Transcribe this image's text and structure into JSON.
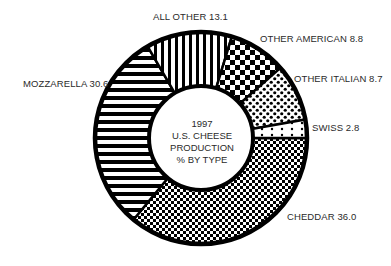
{
  "chart_data": {
    "type": "pie",
    "variant": "donut",
    "title": "1997 U.S. CHEESE PRODUCTION % BY TYPE",
    "center_title_lines": [
      "1997",
      "U.S. CHEESE",
      "PRODUCTION",
      "% BY TYPE"
    ],
    "categories": [
      "CHEDDAR",
      "MOZZARELLA",
      "ALL OTHER",
      "OTHER AMERICAN",
      "OTHER ITALIAN",
      "SWISS"
    ],
    "values": [
      36.0,
      30.6,
      13.1,
      8.8,
      8.7,
      2.8
    ],
    "unit": "%",
    "patterns": {
      "CHEDDAR": "fine-checkerboard",
      "MOZZARELLA": "horizontal-stripes",
      "ALL OTHER": "vertical-stripes",
      "OTHER AMERICAN": "coarse-checkerboard",
      "OTHER ITALIAN": "dense-dots",
      "SWISS": "sparse-dots"
    },
    "legend": "none (direct labels)",
    "colors": {
      "ink": "#000000",
      "background": "#ffffff",
      "label_text": "#2a2a2a"
    }
  },
  "labels": {
    "all_other": "ALL OTHER 13.1",
    "other_american": "OTHER AMERICAN 8.8",
    "other_italian": "OTHER ITALIAN 8.7",
    "swiss": "SWISS 2.8",
    "cheddar": "CHEDDAR 36.0",
    "mozzarella": "MOZZARELLA 30.6"
  },
  "center": {
    "line1": "1997",
    "line2": "U.S. CHEESE",
    "line3": "PRODUCTION",
    "line4": "% BY TYPE"
  }
}
